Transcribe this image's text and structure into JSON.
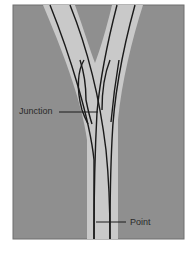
{
  "diagram": {
    "type": "railway-switch",
    "colors": {
      "background": "#ffffff",
      "ground": "#8f8f8f",
      "trackbed": "#c9c9c9",
      "rail": "#1a1a1a",
      "label": "#2a2a2a"
    },
    "labels": {
      "junction": "Junction",
      "point": "Point"
    }
  }
}
